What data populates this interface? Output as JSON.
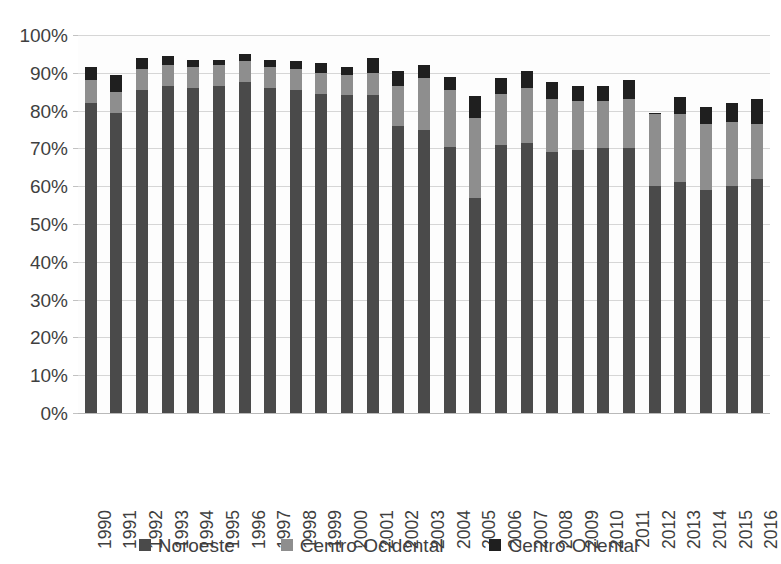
{
  "chart_data": {
    "type": "bar",
    "subtype": "stacked-bar",
    "title": "",
    "subtitle": "",
    "xlabel": "",
    "ylabel": "",
    "ylim": [
      0,
      100
    ],
    "ytick_labels": [
      "100%",
      "90%",
      "80%",
      "70%",
      "60%",
      "50%",
      "40%",
      "30%",
      "20%",
      "10%",
      "0%"
    ],
    "ytick_values": [
      100,
      90,
      80,
      70,
      60,
      50,
      40,
      30,
      20,
      10,
      0
    ],
    "yunit": "%",
    "grid": true,
    "legend_position": "bottom",
    "categories": [
      "1990",
      "1991",
      "1992",
      "1993",
      "1994",
      "1995",
      "1996",
      "1997",
      "1998",
      "1999",
      "2000",
      "2001",
      "2002",
      "2003",
      "2004",
      "2005",
      "2006",
      "2007",
      "2008",
      "2009",
      "2010",
      "2011",
      "2012",
      "2013",
      "2014",
      "2015",
      "2016"
    ],
    "series": [
      {
        "name": "Noroeste",
        "color": "#4a4a4a",
        "values": [
          82.0,
          79.5,
          85.5,
          86.5,
          86.0,
          86.5,
          87.5,
          86.0,
          85.5,
          84.5,
          84.0,
          84.0,
          76.0,
          75.0,
          70.5,
          57.0,
          71.0,
          71.5,
          69.0,
          69.5,
          70.0,
          70.0,
          60.0,
          61.0,
          59.0,
          60.0,
          62.0
        ]
      },
      {
        "name": "Centro-Ocidental",
        "color": "#8e8e8e",
        "values": [
          6.0,
          5.5,
          5.5,
          5.5,
          5.5,
          5.5,
          5.5,
          5.5,
          5.5,
          5.5,
          5.5,
          6.0,
          10.5,
          13.5,
          15.0,
          21.0,
          13.5,
          14.5,
          14.0,
          13.0,
          12.5,
          13.0,
          19.0,
          18.0,
          17.5,
          17.0,
          14.5
        ]
      },
      {
        "name": "Centro-Oriental",
        "color": "#1f1f1f",
        "values": [
          3.5,
          4.5,
          3.0,
          2.5,
          2.0,
          1.5,
          2.0,
          2.0,
          2.0,
          2.5,
          2.0,
          4.0,
          4.0,
          3.5,
          3.5,
          6.0,
          4.0,
          4.5,
          4.5,
          4.0,
          4.0,
          5.0,
          0.5,
          4.5,
          4.5,
          5.0,
          6.5
        ]
      }
    ],
    "totals": [
      91.5,
      89.5,
      94.0,
      94.5,
      93.5,
      93.5,
      95.0,
      93.5,
      93.0,
      92.5,
      91.5,
      94.0,
      90.5,
      92.0,
      89.0,
      84.0,
      88.5,
      90.5,
      87.5,
      86.5,
      86.5,
      88.0,
      79.5,
      83.5,
      81.0,
      82.0,
      83.0
    ]
  },
  "legend": {
    "items": [
      {
        "label": "Noroeste",
        "color": "#4a4a4a"
      },
      {
        "label": "Centro-Ocidental",
        "color": "#8e8e8e"
      },
      {
        "label": "Centro-Oriental",
        "color": "#1f1f1f"
      }
    ]
  }
}
